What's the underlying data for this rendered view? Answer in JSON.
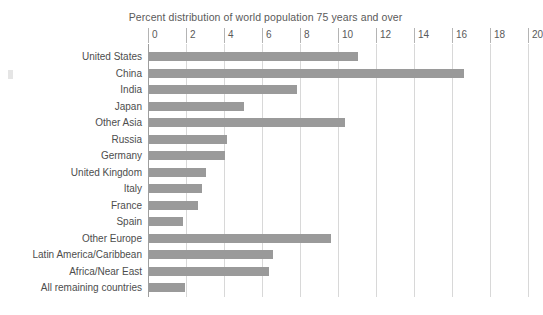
{
  "chart_data": {
    "type": "bar",
    "orientation": "horizontal",
    "title": "Percent distribution of world population 75 years and over",
    "xlabel": "",
    "ylabel": "",
    "xlim": [
      0,
      20
    ],
    "xticks": [
      0,
      2,
      4,
      6,
      8,
      10,
      12,
      14,
      16,
      18,
      20
    ],
    "xtick_labels": [
      "0",
      "2",
      "4",
      "6",
      "8",
      "10",
      "12",
      "14",
      "16",
      "18",
      "20"
    ],
    "grid": true,
    "legend": false,
    "bar_color": "#9a9a9a",
    "categories": [
      "United States",
      "China",
      "India",
      "Japan",
      "Other Asia",
      "Russia",
      "Germany",
      "United Kingdom",
      "Italy",
      "France",
      "Spain",
      "Other Europe",
      "Latin America/Caribbean",
      "Africa/Near East",
      "All remaining countries"
    ],
    "values": [
      11.0,
      16.6,
      7.8,
      5.0,
      10.3,
      4.1,
      4.0,
      3.0,
      2.8,
      2.6,
      1.8,
      9.6,
      6.5,
      6.3,
      1.9
    ]
  }
}
